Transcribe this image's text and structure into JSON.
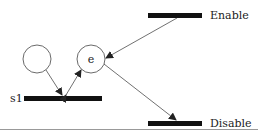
{
  "diagram": {
    "type": "petri-net",
    "places": [
      {
        "id": "p1",
        "label": "",
        "cx": 37,
        "cy": 59,
        "r": 14
      },
      {
        "id": "e",
        "label": "e",
        "cx": 91,
        "cy": 59,
        "r": 14
      }
    ],
    "transitions": [
      {
        "id": "s1",
        "label": "s1",
        "x": 24,
        "y": 96,
        "w": 78,
        "h": 5
      },
      {
        "id": "enable",
        "label": "Enable",
        "x": 148,
        "y": 13,
        "w": 54,
        "h": 5
      },
      {
        "id": "disable",
        "label": "Disable",
        "x": 148,
        "y": 121,
        "w": 54,
        "h": 5
      }
    ],
    "arcs": [
      {
        "from": "p1",
        "to": "s1"
      },
      {
        "from": "s1",
        "to": "e",
        "bidirectional": true
      },
      {
        "from": "enable",
        "to": "e"
      },
      {
        "from": "e",
        "to": "disable"
      }
    ]
  },
  "colors": {
    "stroke": "#333333",
    "bar": "#111111",
    "rule": "#999999"
  }
}
